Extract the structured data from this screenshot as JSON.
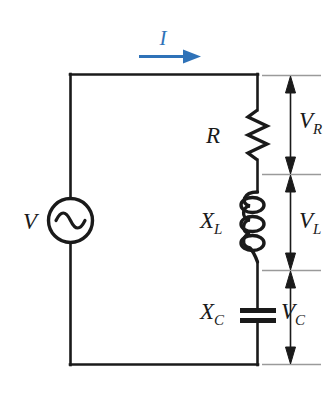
{
  "figure": {
    "type": "series-rlc-circuit-diagram",
    "background_color": "#ffffff",
    "wire_color": "#1a1a1a",
    "current_color": "#2f72b8",
    "dimension_color": "#8a8a8a"
  },
  "source": {
    "name": "ac-voltage-source",
    "label": "V",
    "icon": "ac-source-icon"
  },
  "current": {
    "label": "I",
    "icon": "current-arrow-icon",
    "direction": "right",
    "color": "#2f72b8"
  },
  "components": [
    {
      "id": "resistor",
      "icon": "resistor-zigzag-icon",
      "label": "X",
      "label_main": "R",
      "label_sub": "",
      "voltage_main": "V",
      "voltage_sub": "R"
    },
    {
      "id": "inductor",
      "icon": "inductor-coil-icon",
      "label_main": "X",
      "label_sub": "L",
      "voltage_main": "V",
      "voltage_sub": "L"
    },
    {
      "id": "capacitor",
      "icon": "capacitor-plates-icon",
      "label_main": "X",
      "label_sub": "C",
      "voltage_main": "V",
      "voltage_sub": "C"
    }
  ],
  "labels": {
    "source_v": "V",
    "current_i": "I",
    "resistor_r": "R",
    "reactance_x": "X",
    "sub_l": "L",
    "sub_c": "C",
    "sub_r": "R",
    "voltage_v": "V"
  }
}
